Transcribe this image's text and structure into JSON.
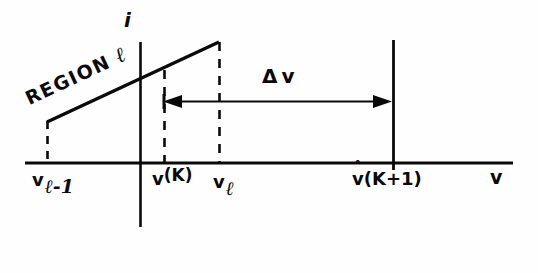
{
  "figure": {
    "type": "line-diagram",
    "background_color": "#fefefe",
    "ink_color": "#0a0a0a",
    "axes": {
      "vertical_label": "i",
      "horizontal_label": "v"
    },
    "annotations": {
      "region_prefix": "REGION",
      "region_index": "ℓ",
      "delta_symbol": "Δ",
      "delta_variable": "v"
    },
    "tick_labels": [
      {
        "id": "v-l-minus-1",
        "base": "v",
        "sub": "ℓ-1",
        "sup": ""
      },
      {
        "id": "v-sup-K",
        "base": "v",
        "sub": "",
        "sup": "(K)"
      },
      {
        "id": "v-sub-l",
        "base": "v",
        "sub": "ℓ",
        "sup": ""
      },
      {
        "id": "v-hat-K-plus-1",
        "base": "v",
        "hat": "ˆ",
        "suffix": "(K+1)"
      }
    ],
    "geometry": {
      "x_axis": {
        "x1": 25,
        "x2": 513,
        "y": 163
      },
      "y_axis": {
        "x": 140,
        "y1": 42,
        "y2": 227
      },
      "slope_line": {
        "x1": 47,
        "y1": 122,
        "x2": 219,
        "y2": 42
      },
      "dashed_verticals": [
        {
          "x": 47,
          "y1": 122,
          "y2": 163
        },
        {
          "x": 164,
          "y1": 70,
          "y2": 163
        },
        {
          "x": 219,
          "y1": 42,
          "y2": 163
        }
      ],
      "solid_vertical": {
        "x": 393,
        "y1": 40,
        "y2": 170
      },
      "span_arrow": {
        "x1": 164,
        "x2": 391,
        "y": 101
      }
    }
  }
}
